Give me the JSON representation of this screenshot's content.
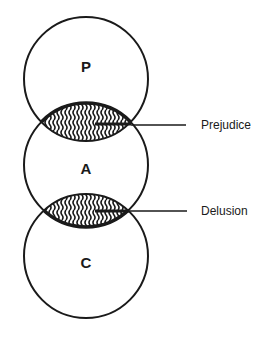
{
  "diagram": {
    "circles": [
      {
        "id": "P",
        "label": "P",
        "cx": 86,
        "cy": 79,
        "r": 62
      },
      {
        "id": "A",
        "label": "A",
        "cx": 86,
        "cy": 165,
        "r": 62
      },
      {
        "id": "C",
        "label": "C",
        "cx": 86,
        "cy": 256,
        "r": 62
      }
    ],
    "overlaps": [
      {
        "between": [
          "P",
          "A"
        ],
        "label": "Prejudice",
        "pattern": "wavy-hatch"
      },
      {
        "between": [
          "A",
          "C"
        ],
        "label": "Delusion",
        "pattern": "wavy-hatch"
      }
    ],
    "colors": {
      "stroke": "#1a1a1a",
      "background": "#ffffff"
    }
  }
}
